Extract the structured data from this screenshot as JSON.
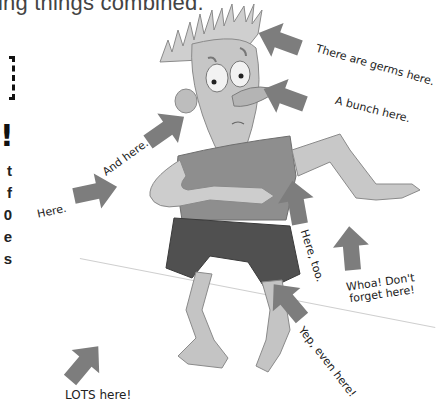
{
  "page": {
    "header_fragment": "ing things combined.",
    "exclamation_fragment": "!",
    "left_column_fragments": [
      "t",
      "f",
      "0",
      "e",
      "s"
    ]
  },
  "illustration": {
    "subject": "Cartoon boy with spiky hair, worried expression, arms out, barefoot, red-shirt-and-shorts shown in grayscale",
    "arrow_color": "#7d7d7d",
    "labels": [
      {
        "id": "head",
        "text": "There are germs here."
      },
      {
        "id": "nose",
        "text": "A bunch here."
      },
      {
        "id": "ear",
        "text": "And here."
      },
      {
        "id": "elbow",
        "text": "Here."
      },
      {
        "id": "hand-chest",
        "text": "Here, too."
      },
      {
        "id": "right-hand",
        "text": "Whoa! Don't forget here!"
      },
      {
        "id": "knee",
        "text": "Yep, even here!"
      },
      {
        "id": "foot",
        "text": "LOTS here!"
      }
    ]
  }
}
